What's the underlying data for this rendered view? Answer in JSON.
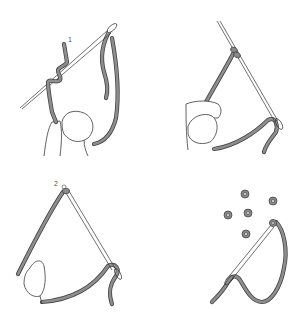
{
  "figure": {
    "title": "",
    "panels": [
      {
        "id": "panel-1",
        "position": "top-left",
        "step_label": "1",
        "description": "Thread wrapped around needle near exit point, loop passing through needle eye, held by fingers"
      },
      {
        "id": "panel-2",
        "position": "top-right",
        "description": "Wraps slid down needle to fabric, needle pulled through while thumb holds thread"
      },
      {
        "id": "panel-3",
        "position": "bottom-left",
        "step_label": "2",
        "description": "Knot formed at point 2, needle pulled through knot"
      },
      {
        "id": "panel-4",
        "position": "bottom-right",
        "description": "Finished knot with scattered completed beads/knots nearby"
      }
    ],
    "colors": {
      "background": "#ffffff",
      "thread_fill": "#8e8e8e",
      "thread_outline": "#444444",
      "line": "#333333"
    },
    "beads_count": 5
  }
}
